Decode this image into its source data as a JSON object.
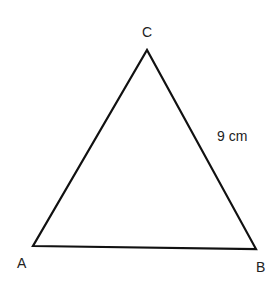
{
  "diagram": {
    "type": "triangle",
    "vertices": {
      "A": {
        "label": "A",
        "x": 33,
        "y": 246
      },
      "B": {
        "label": "B",
        "x": 256,
        "y": 249
      },
      "C": {
        "label": "C",
        "x": 147,
        "y": 50
      }
    },
    "side_labels": {
      "BC": "9 cm"
    },
    "stroke_color": "#111111"
  }
}
